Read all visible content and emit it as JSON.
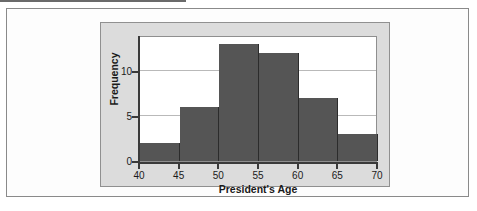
{
  "figure": {
    "panel_background": "#dcdcdc",
    "plot_background": "#ffffff",
    "bar_color": "#555555",
    "axis_color": "#3a3a3a",
    "gridline_color": "#b9b9b9"
  },
  "chart_data": {
    "type": "bar",
    "title": "",
    "xlabel": "President's Age",
    "ylabel": "Frequency",
    "categories": [
      "40-45",
      "45-50",
      "50-55",
      "55-60",
      "60-65",
      "65-70"
    ],
    "bin_edges": [
      40,
      45,
      50,
      55,
      60,
      65,
      70
    ],
    "values": [
      2,
      6,
      13,
      12,
      7,
      3
    ],
    "xlim": [
      40,
      70
    ],
    "ylim": [
      0,
      14
    ],
    "xticks": [
      40,
      45,
      50,
      55,
      60,
      65,
      70
    ],
    "xtick_labels": [
      "40",
      "45",
      "50",
      "55",
      "60",
      "65",
      "70"
    ],
    "yticks": [
      0,
      5,
      10
    ],
    "ytick_labels": [
      "0",
      "5",
      "10"
    ],
    "gridlines": [
      "horizontal at 5",
      "horizontal at 10"
    ],
    "legend": null
  }
}
